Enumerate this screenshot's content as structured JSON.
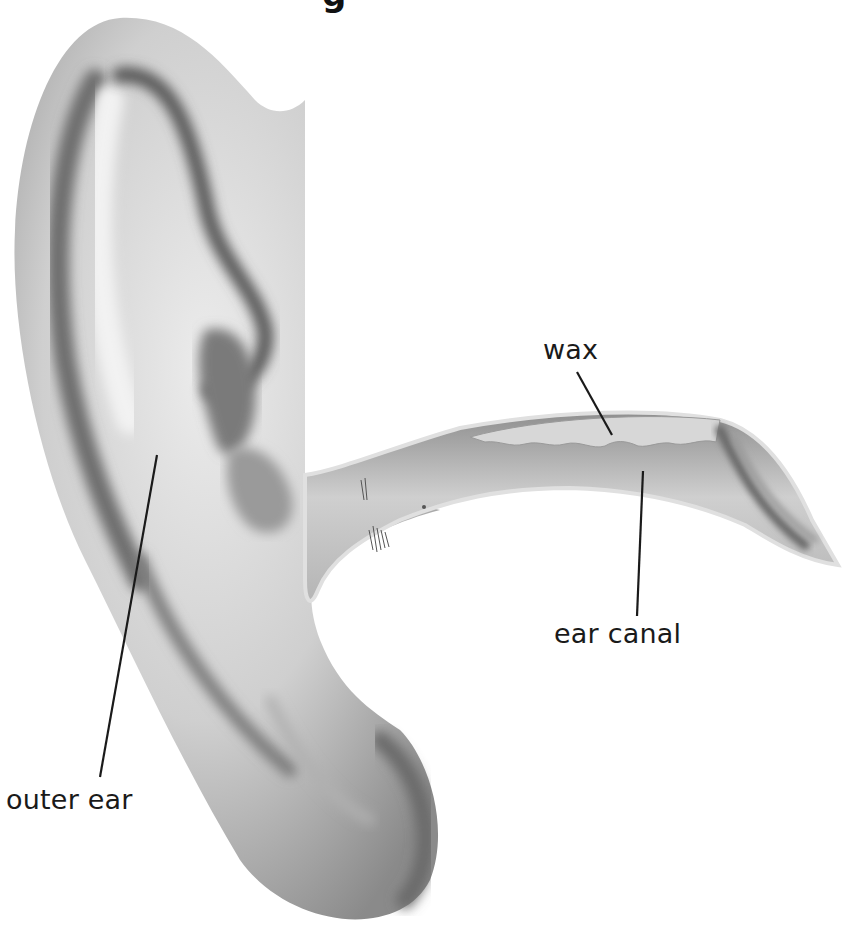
{
  "diagram": {
    "title_fragment": "g",
    "labels": [
      {
        "id": "wax",
        "text": "wax"
      },
      {
        "id": "ear-canal",
        "text": "ear canal"
      },
      {
        "id": "outer-ear",
        "text": "outer ear"
      }
    ],
    "colors": {
      "background": "#ffffff",
      "skin_light": "#e6e6e6",
      "skin_mid": "#bdbdbd",
      "skin_dark": "#6f6f6f",
      "canal_fill": "#c9c9c9",
      "wax_fill": "#d9d9d9",
      "leader_line": "#1a1a1a",
      "label_text": "#1a1a1a"
    }
  }
}
